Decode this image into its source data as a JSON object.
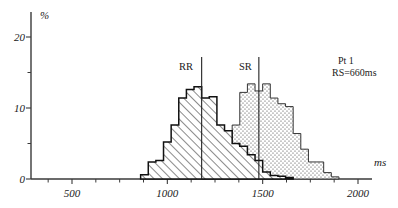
{
  "figure": {
    "y_axis_title": "%",
    "x_axis_title": "ms",
    "y_ticks": [
      "0",
      "10",
      "20"
    ],
    "x_ticks": [
      "500",
      "1000",
      "1500",
      "2000"
    ],
    "annotation_line1": "Pt 1",
    "annotation_line2": "RS=660ms",
    "series_label_rr": "RR",
    "series_label_sr": "SR"
  },
  "chart_data": {
    "type": "bar",
    "title": "",
    "subtitle": "",
    "xlabel": "ms",
    "ylabel": "%",
    "xlim": [
      300,
      2175
    ],
    "ylim": [
      0,
      24
    ],
    "grid": false,
    "legend_position": "in-plot-inline-labels",
    "bin_width_ms": 40,
    "annotations": [
      {
        "text": "Pt 1",
        "x": 2020,
        "y": 20.5
      },
      {
        "text": "RS=660ms",
        "x": 2020,
        "y": 18.9
      },
      {
        "text": "RR",
        "x": 1160,
        "y": 16.3
      },
      {
        "text": "SR",
        "x": 1460,
        "y": 16.3
      }
    ],
    "vertical_markers": [
      {
        "name": "RR-mean-marker",
        "x": 1180,
        "y_top": 17.2,
        "label": "RR"
      },
      {
        "name": "SR-mean-marker",
        "x": 1480,
        "y_top": 17.2,
        "label": "SR"
      }
    ],
    "y_tick_values": [
      0,
      10,
      20
    ],
    "y_minor_tick_values": [
      5,
      15
    ],
    "x_tick_values": [
      500,
      1000,
      1500,
      2000
    ],
    "x_minor_tick_values": [
      375,
      625,
      750,
      875,
      1125,
      1250,
      1375,
      1625,
      1750,
      1875
    ],
    "series": [
      {
        "name": "RR",
        "pattern": "diagonal-hatch",
        "bin_starts": [
          860,
          900,
          940,
          980,
          1020,
          1060,
          1100,
          1140,
          1180,
          1220,
          1260,
          1300,
          1340,
          1380,
          1420,
          1460,
          1500,
          1540,
          1580,
          1620
        ],
        "values": [
          0.6,
          2.4,
          2.6,
          5.2,
          7.6,
          11.4,
          12.6,
          13.0,
          11.4,
          11.6,
          7.6,
          6.8,
          5.0,
          4.6,
          3.4,
          2.6,
          1.0,
          0.5,
          0.4,
          0.2
        ]
      },
      {
        "name": "SR",
        "pattern": "dotted-stipple",
        "bin_starts": [
          1180,
          1220,
          1260,
          1300,
          1340,
          1380,
          1420,
          1460,
          1500,
          1540,
          1580,
          1620,
          1660,
          1700,
          1740,
          1780,
          1820,
          1860
        ],
        "values": [
          0.7,
          0.7,
          1.6,
          2.6,
          7.6,
          12.2,
          13.4,
          12.4,
          13.4,
          11.4,
          10.6,
          10.2,
          6.4,
          4.2,
          2.4,
          2.4,
          0.9,
          0.3
        ]
      }
    ]
  }
}
